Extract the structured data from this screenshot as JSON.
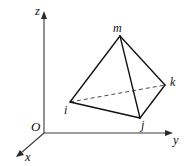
{
  "figure": {
    "background_color": "#ffffff",
    "width": 184,
    "height": 166,
    "stroke_color": "#111111",
    "axis_color": "#3a3a3a",
    "hidden_edge_color": "#4a4a4a"
  },
  "axes": {
    "origin_label": "O",
    "x_label": "x",
    "y_label": "y",
    "z_label": "z",
    "origin_point": [
      44,
      133
    ],
    "x_tip": [
      17,
      157
    ],
    "y_tip": [
      172,
      133
    ],
    "z_tip": [
      44,
      12
    ]
  },
  "vertices": [
    {
      "id": "i",
      "label": "i",
      "x": 70,
      "y": 102,
      "label_x": 64,
      "label_y": 106
    },
    {
      "id": "j",
      "label": "j",
      "x": 140,
      "y": 118,
      "label_x": 141,
      "label_y": 121
    },
    {
      "id": "k",
      "label": "k",
      "x": 165,
      "y": 85,
      "label_x": 170,
      "label_y": 78
    },
    {
      "id": "m",
      "label": "m",
      "x": 120,
      "y": 36,
      "label_x": 114,
      "label_y": 23
    }
  ],
  "edges": [
    {
      "from": "m",
      "to": "i",
      "style": "solid"
    },
    {
      "from": "m",
      "to": "j",
      "style": "solid"
    },
    {
      "from": "m",
      "to": "k",
      "style": "solid"
    },
    {
      "from": "i",
      "to": "j",
      "style": "solid"
    },
    {
      "from": "j",
      "to": "k",
      "style": "solid"
    },
    {
      "from": "i",
      "to": "k",
      "style": "dashed"
    }
  ]
}
